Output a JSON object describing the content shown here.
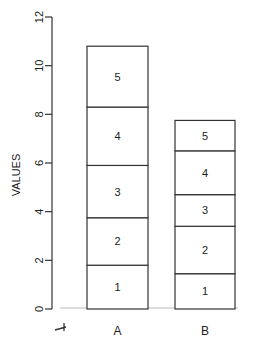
{
  "chart_data": {
    "type": "bar",
    "stacked": true,
    "title": "",
    "xlabel": "",
    "ylabel": "VALUES",
    "ylim": [
      0,
      12
    ],
    "yticks": [
      0,
      2,
      4,
      6,
      8,
      10,
      12
    ],
    "categories": [
      "A",
      "B"
    ],
    "series": [
      {
        "name": "1",
        "values": [
          1.8,
          1.45
        ]
      },
      {
        "name": "2",
        "values": [
          1.95,
          1.95
        ]
      },
      {
        "name": "3",
        "values": [
          2.15,
          1.3
        ]
      },
      {
        "name": "4",
        "values": [
          2.4,
          1.8
        ]
      },
      {
        "name": "5",
        "values": [
          2.5,
          1.25
        ]
      }
    ],
    "grid": false,
    "legend": "none (segment labels inside bars)"
  },
  "colors": {
    "bar_fill": "#ffffff",
    "bar_stroke": "#333333",
    "axis": "#333333"
  }
}
